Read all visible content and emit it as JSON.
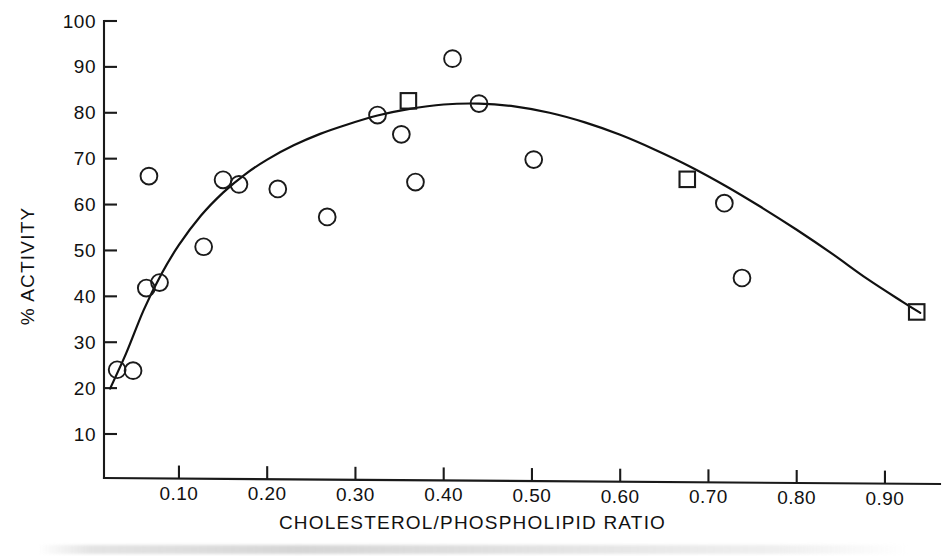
{
  "chart_data": {
    "type": "scatter",
    "title": "",
    "subtitle": "",
    "xlabel": "CHOLESTEROL/PHOSPHOLIPID RATIO",
    "ylabel": "% ACTIVITY",
    "xlim": [
      0.0,
      0.96
    ],
    "ylim": [
      0,
      100
    ],
    "grid": false,
    "legend_position": "none",
    "x_ticks": [
      0.1,
      0.2,
      0.3,
      0.4,
      0.5,
      0.6,
      0.7,
      0.8,
      0.9
    ],
    "x_tick_labels": [
      "0.10",
      "0.20",
      "0.30",
      "0.40",
      "0.50",
      "0.60",
      "0.70",
      "0.80",
      "0.90"
    ],
    "y_ticks": [
      10,
      20,
      30,
      40,
      50,
      60,
      70,
      80,
      90,
      100
    ],
    "y_tick_labels": [
      "10",
      "20",
      "30",
      "40",
      "50",
      "60",
      "70",
      "80",
      "90",
      "100"
    ],
    "series": [
      {
        "name": "open-circle-data",
        "marker": "circle",
        "points": [
          {
            "x": 0.03,
            "y": 24.0
          },
          {
            "x": 0.048,
            "y": 23.8
          },
          {
            "x": 0.063,
            "y": 41.8
          },
          {
            "x": 0.066,
            "y": 66.2
          },
          {
            "x": 0.078,
            "y": 43.0
          },
          {
            "x": 0.128,
            "y": 50.8
          },
          {
            "x": 0.15,
            "y": 65.4
          },
          {
            "x": 0.168,
            "y": 64.4
          },
          {
            "x": 0.212,
            "y": 63.4
          },
          {
            "x": 0.268,
            "y": 57.3
          },
          {
            "x": 0.325,
            "y": 79.5
          },
          {
            "x": 0.352,
            "y": 75.3
          },
          {
            "x": 0.368,
            "y": 64.9
          },
          {
            "x": 0.41,
            "y": 91.8
          },
          {
            "x": 0.44,
            "y": 82.0
          },
          {
            "x": 0.502,
            "y": 69.8
          },
          {
            "x": 0.718,
            "y": 60.3
          },
          {
            "x": 0.738,
            "y": 44.0
          }
        ]
      },
      {
        "name": "open-square-data",
        "marker": "square",
        "points": [
          {
            "x": 0.36,
            "y": 82.6
          },
          {
            "x": 0.676,
            "y": 65.5
          },
          {
            "x": 0.936,
            "y": 36.6
          }
        ]
      }
    ],
    "fitted_curve": {
      "name": "fitted-trend-curve",
      "points": [
        {
          "x": 0.022,
          "y": 19.9
        },
        {
          "x": 0.04,
          "y": 27.5
        },
        {
          "x": 0.06,
          "y": 37.0
        },
        {
          "x": 0.08,
          "y": 44.8
        },
        {
          "x": 0.1,
          "y": 51.2
        },
        {
          "x": 0.125,
          "y": 57.6
        },
        {
          "x": 0.15,
          "y": 62.6
        },
        {
          "x": 0.175,
          "y": 66.6
        },
        {
          "x": 0.2,
          "y": 69.8
        },
        {
          "x": 0.23,
          "y": 72.9
        },
        {
          "x": 0.26,
          "y": 75.4
        },
        {
          "x": 0.29,
          "y": 77.4
        },
        {
          "x": 0.325,
          "y": 79.4
        },
        {
          "x": 0.36,
          "y": 80.8
        },
        {
          "x": 0.4,
          "y": 81.8
        },
        {
          "x": 0.44,
          "y": 82.0
        },
        {
          "x": 0.48,
          "y": 81.4
        },
        {
          "x": 0.52,
          "y": 80.0
        },
        {
          "x": 0.56,
          "y": 77.9
        },
        {
          "x": 0.6,
          "y": 75.2
        },
        {
          "x": 0.64,
          "y": 71.9
        },
        {
          "x": 0.68,
          "y": 68.2
        },
        {
          "x": 0.72,
          "y": 64.0
        },
        {
          "x": 0.76,
          "y": 59.4
        },
        {
          "x": 0.8,
          "y": 54.5
        },
        {
          "x": 0.84,
          "y": 49.3
        },
        {
          "x": 0.88,
          "y": 43.8
        },
        {
          "x": 0.92,
          "y": 38.8
        },
        {
          "x": 0.94,
          "y": 36.4
        }
      ]
    }
  }
}
